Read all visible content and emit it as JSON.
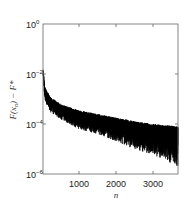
{
  "chart_data": {
    "type": "line",
    "title": "",
    "xlabel": "n",
    "ylabel": "F(x_n) - F*",
    "yscale": "log",
    "xlim": [
      0,
      3700
    ],
    "ylim": [
      1e-06,
      1
    ],
    "xticks": [
      1000,
      2000,
      3000
    ],
    "xtick_labels": [
      "1000",
      "2000",
      "3000"
    ],
    "yticks": [
      1e-06,
      0.0001,
      0.01,
      1
    ],
    "ytick_labels": [
      "10^-6",
      "10^-4",
      "10^-2",
      "10^0"
    ],
    "grid": false,
    "legend": null,
    "series": [
      {
        "name": "F(x_n) - F*",
        "color": "#000000",
        "description": "oscillating decay; upper envelope and lower envelope",
        "upper_envelope": {
          "x": [
            0,
            50,
            200,
            500,
            1000,
            1500,
            2000,
            2500,
            3000,
            3700
          ],
          "y": [
            0.02,
            0.003,
            0.0012,
            0.0006,
            0.00035,
            0.00025,
            0.00018,
            0.00013,
            0.0001,
            8e-05
          ]
        },
        "lower_envelope": {
          "x": [
            0,
            50,
            200,
            500,
            1000,
            1500,
            2000,
            2500,
            3000,
            3700
          ],
          "y": [
            0.01,
            0.0008,
            0.0003,
            0.00015,
            6e-05,
            4e-05,
            2e-05,
            1e-05,
            6e-06,
            2e-06
          ]
        }
      }
    ]
  },
  "axes": {
    "xlabel": "n",
    "ylabel_main": "F(x",
    "ylabel_sub": "n",
    "ylabel_tail": ") − F*",
    "xticks": [
      "1000",
      "2000",
      "3000"
    ],
    "yticks": [
      {
        "base": "10",
        "exp": "0"
      },
      {
        "base": "10",
        "exp": "−2"
      },
      {
        "base": "10",
        "exp": "−4"
      },
      {
        "base": "10",
        "exp": "−6"
      }
    ]
  }
}
